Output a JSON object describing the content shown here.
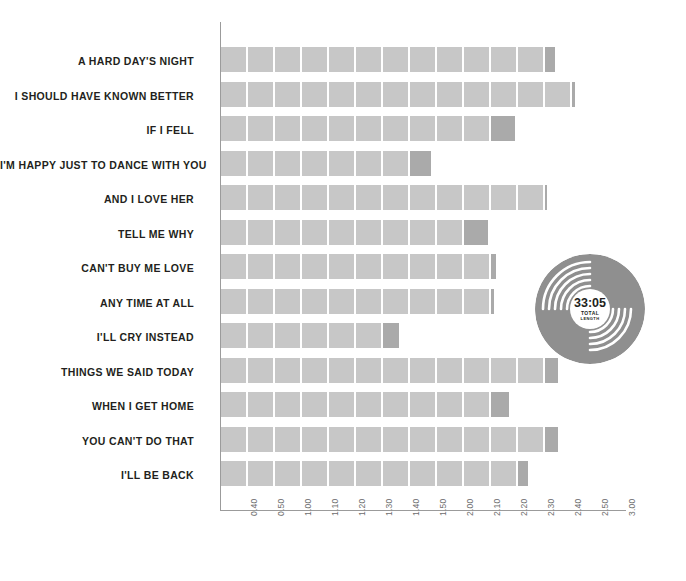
{
  "chart_data": {
    "type": "bar",
    "title": "",
    "subtitle": "",
    "xlabel": "",
    "ylabel": "",
    "orientation": "horizontal",
    "grid": false,
    "legend": "none",
    "segment_seconds": 10,
    "axis_start_label": "0.30",
    "xlim": [
      "0.30",
      "3.00"
    ],
    "tick_labels": [
      "0.40",
      "0.50",
      "1.00",
      "1.10",
      "1.20",
      "1.30",
      "1.40",
      "1.50",
      "2.00",
      "2.10",
      "2.20",
      "2.30",
      "2.40",
      "2.50",
      "3.00"
    ],
    "categories": [
      "A HARD DAY'S NIGHT",
      "I SHOULD HAVE KNOWN BETTER",
      "IF I FELL",
      "I'M HAPPY JUST TO DANCE WITH YOU",
      "AND I LOVE HER",
      "TELL ME WHY",
      "CAN'T BUY ME LOVE",
      "ANY TIME AT ALL",
      "I'LL CRY INSTEAD",
      "THINGS WE SAID TODAY",
      "WHEN I GET HOME",
      "YOU CAN'T DO THAT",
      "I'LL BE BACK"
    ],
    "values": [
      2.34,
      2.44,
      2.19,
      1.58,
      2.3,
      2.09,
      2.12,
      2.11,
      1.46,
      2.35,
      2.17,
      2.35,
      2.24
    ],
    "bars": [
      {
        "label": "A HARD DAY'S NIGHT",
        "value": "2.34",
        "full_segments": 12,
        "remainder_fraction": 0.42
      },
      {
        "label": "I SHOULD HAVE KNOWN BETTER",
        "value": "2.44",
        "full_segments": 13,
        "remainder_fraction": 0.14
      },
      {
        "label": "IF I FELL",
        "value": "2.19",
        "full_segments": 10,
        "remainder_fraction": 0.95
      },
      {
        "label": "I'M HAPPY JUST TO DANCE WITH YOU",
        "value": "1.58",
        "full_segments": 7,
        "remainder_fraction": 0.85
      },
      {
        "label": "AND I LOVE HER",
        "value": "2.30",
        "full_segments": 12,
        "remainder_fraction": 0.02
      },
      {
        "label": "TELL ME WHY",
        "value": "2.09",
        "full_segments": 9,
        "remainder_fraction": 0.95
      },
      {
        "label": "CAN'T BUY ME LOVE",
        "value": "2.12",
        "full_segments": 10,
        "remainder_fraction": 0.2
      },
      {
        "label": "ANY TIME AT ALL",
        "value": "2.11",
        "full_segments": 10,
        "remainder_fraction": 0.12
      },
      {
        "label": "I'LL CRY INSTEAD",
        "value": "1.46",
        "full_segments": 6,
        "remainder_fraction": 0.62
      },
      {
        "label": "THINGS WE SAID TODAY",
        "value": "2.35",
        "full_segments": 12,
        "remainder_fraction": 0.5
      },
      {
        "label": "WHEN I GET HOME",
        "value": "2.17",
        "full_segments": 10,
        "remainder_fraction": 0.72
      },
      {
        "label": "YOU CAN'T DO THAT",
        "value": "2.35",
        "full_segments": 12,
        "remainder_fraction": 0.5
      },
      {
        "label": "I'LL BE BACK",
        "value": "2.24",
        "full_segments": 11,
        "remainder_fraction": 0.4
      }
    ],
    "annotation": {
      "name": "vinyl-record-total",
      "time": "33:05",
      "caption_line1": "TOTAL",
      "caption_line2": "LENGTH"
    },
    "colors": {
      "segment": "#c7c7c7",
      "remainder": "#aaaaaa",
      "axis": "#9b9b9b",
      "label_text": "#231f20",
      "tick_text": "#6d6d6d",
      "record": "#8f8f8f",
      "background": "#ffffff"
    }
  }
}
